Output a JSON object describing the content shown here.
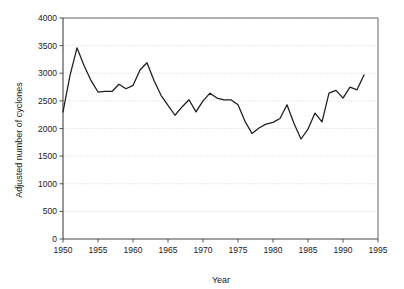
{
  "chart_data": {
    "type": "line",
    "title": "",
    "xlabel": "Year",
    "ylabel": "Adjusted number of cyclones",
    "xlim": [
      1950,
      1995
    ],
    "ylim": [
      0,
      4000
    ],
    "grid": "horizontal-dotted",
    "legend": "none",
    "line_color": "#1c1c1c",
    "x": [
      1950,
      1951,
      1952,
      1953,
      1954,
      1955,
      1956,
      1957,
      1958,
      1959,
      1960,
      1961,
      1962,
      1963,
      1964,
      1965,
      1966,
      1967,
      1968,
      1969,
      1970,
      1971,
      1972,
      1973,
      1974,
      1975,
      1976,
      1977,
      1978,
      1979,
      1980,
      1981,
      1982,
      1983,
      1984,
      1985,
      1986,
      1987,
      1988,
      1989,
      1990,
      1991,
      1992,
      1993
    ],
    "values": [
      2300,
      2960,
      3460,
      3140,
      2870,
      2660,
      2670,
      2670,
      2800,
      2720,
      2780,
      3060,
      3190,
      2870,
      2600,
      2420,
      2240,
      2390,
      2520,
      2300,
      2500,
      2640,
      2550,
      2520,
      2520,
      2430,
      2130,
      1910,
      2010,
      2080,
      2110,
      2180,
      2430,
      2090,
      1810,
      1990,
      2280,
      2120,
      2640,
      2690,
      2550,
      2750,
      2700,
      2970
    ],
    "series": [
      {
        "name": "Adjusted number of cyclones",
        "values": [
          2300,
          2960,
          3460,
          3140,
          2870,
          2660,
          2670,
          2670,
          2800,
          2720,
          2780,
          3060,
          3190,
          2870,
          2600,
          2420,
          2240,
          2390,
          2520,
          2300,
          2500,
          2640,
          2550,
          2520,
          2520,
          2430,
          2130,
          1910,
          2010,
          2080,
          2110,
          2180,
          2430,
          2090,
          1810,
          1990,
          2280,
          2120,
          2640,
          2690,
          2550,
          2750,
          2700,
          2970
        ]
      }
    ],
    "x_ticks": [
      1950,
      1955,
      1960,
      1965,
      1970,
      1975,
      1980,
      1985,
      1990,
      1995
    ],
    "x_tick_labels": [
      "1950",
      "1955",
      "1960",
      "1965",
      "1970",
      "1975",
      "1980",
      "1985",
      "1990",
      "1995"
    ],
    "y_ticks": [
      0,
      500,
      1000,
      1500,
      2000,
      2500,
      3000,
      3500,
      4000
    ],
    "y_tick_labels": [
      "0",
      "500",
      "1000",
      "1500",
      "2000",
      "2500",
      "3000",
      "3500",
      "4000"
    ]
  }
}
